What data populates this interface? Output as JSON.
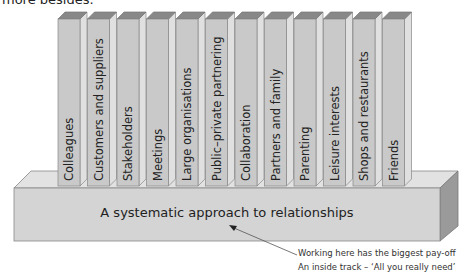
{
  "top_text": "more besides.",
  "base": {
    "label": "A systematic approach to relationships"
  },
  "pillars": [
    {
      "label": "Colleagues"
    },
    {
      "label": "Customers and suppliers"
    },
    {
      "label": "Stakeholders"
    },
    {
      "label": "Meetings"
    },
    {
      "label": "Large organisations"
    },
    {
      "label": "Public–private partnering"
    },
    {
      "label": "Collaboration"
    },
    {
      "label": "Partners and family"
    },
    {
      "label": "Parenting"
    },
    {
      "label": "Leisure interests"
    },
    {
      "label": "Shops and restaurants"
    },
    {
      "label": "Friends"
    }
  ],
  "annotation": {
    "line1": "Working here has the biggest pay-off",
    "line2": "An inside track – ‘All you really need’"
  },
  "colors": {
    "front": "#c8c8c8",
    "side": "#dcdcdc",
    "top": "#8a8a8a",
    "base_front": "#d2d2d2",
    "base_top": "#e2e2e2",
    "base_side": "#9a9a9a"
  }
}
